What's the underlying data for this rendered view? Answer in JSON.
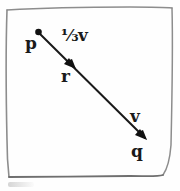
{
  "figure": {
    "background_color": "#fefefe",
    "ink_color": "#1a1a1a",
    "border_color": "#8d8d8d",
    "labels": {
      "start_point": "p",
      "mid_point": "r",
      "end_point": "q",
      "vector_full": "v",
      "vector_fraction_numerator": "1",
      "vector_fraction_slash": "⁄",
      "vector_fraction_denominator": "3",
      "vector_fraction_symbol": "v",
      "vector_fraction_full": "⅓v"
    },
    "geometry": {
      "p_dot": {
        "x": 38,
        "y": 32,
        "r": 3.2
      },
      "r_arrow_tip": {
        "x": 75,
        "y": 68
      },
      "q_arrow_tip": {
        "x": 146,
        "y": 139
      },
      "line_from": {
        "x": 38,
        "y": 32
      },
      "line_to": {
        "x": 146,
        "y": 139
      },
      "border_path": "M 7,9 L 172,7 L 170,170 Q 169,176 162,176 L 10,177 Z"
    }
  }
}
